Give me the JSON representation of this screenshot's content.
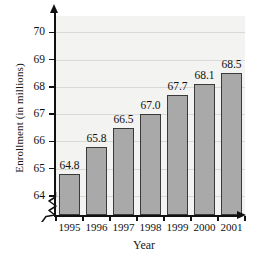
{
  "chart_data": {
    "type": "bar",
    "title": "",
    "xlabel": "Year",
    "ylabel": "Enrollment (in millions)",
    "categories": [
      "1995",
      "1996",
      "1997",
      "1998",
      "1999",
      "2000",
      "2001"
    ],
    "values": [
      64.8,
      65.8,
      66.5,
      67.0,
      67.7,
      68.1,
      68.5
    ],
    "value_labels": [
      "64.8",
      "65.8",
      "66.5",
      "67.0",
      "67.7",
      "68.1",
      "68.5"
    ],
    "yticks": [
      64,
      65,
      66,
      67,
      68,
      69,
      70
    ],
    "ytick_labels": [
      "64",
      "65",
      "66",
      "67",
      "68",
      "69",
      "70"
    ],
    "ylim": [
      63.3,
      70.6
    ],
    "axis_break": true,
    "axis_break_note": "zigzag break on y-axis below 64",
    "grid": true,
    "grid_axis": "y",
    "legend": false,
    "legend_position": "none",
    "colors": {
      "bar_fill": "#a9a9a9",
      "bar_stroke": "#3a3a3a",
      "plot_background": "#f3f3f1",
      "gridline": "#d9d9d6",
      "axis": "#111111",
      "text": "#111111",
      "page_background": "#ffffff"
    }
  }
}
